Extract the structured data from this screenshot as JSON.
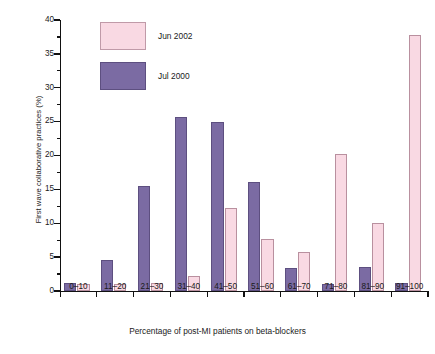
{
  "chart_data": {
    "type": "bar",
    "title": "",
    "xlabel": "Percentage of post-MI patients on beta-blockers",
    "ylabel": "First wave collaborative practices (%)",
    "categories": [
      "0–10",
      "11–20",
      "21–30",
      "31–40",
      "41–50",
      "51–60",
      "61–70",
      "71–80",
      "81–90",
      "91–100"
    ],
    "series": [
      {
        "name": "Jun 2002",
        "color": "#f9d9e3",
        "values": [
          1.1,
          1.1,
          1.2,
          2.2,
          12.2,
          7.7,
          5.8,
          20.2,
          10.0,
          37.8
        ]
      },
      {
        "name": "Jul 2000",
        "color": "#7b6ba3",
        "values": [
          1.2,
          4.6,
          15.5,
          25.7,
          25.0,
          16.1,
          3.4,
          1.1,
          3.5,
          1.2
        ]
      }
    ],
    "ylim": [
      0,
      40
    ],
    "yticks": [
      0,
      5,
      10,
      15,
      20,
      25,
      30,
      35,
      40
    ],
    "yticklabels": [
      "0",
      "5",
      "10",
      "15",
      "20",
      "25",
      "30",
      "35",
      "40"
    ],
    "yminorticks": [
      2.5,
      7.5,
      12.5,
      17.5,
      22.5,
      27.5,
      32.5,
      37.5
    ],
    "grid": false,
    "legend_position": "upper-left-inside"
  },
  "legend": {
    "entries": [
      {
        "label": "Jun 2002",
        "color": "#f9d9e3"
      },
      {
        "label": "Jul 2000",
        "color": "#7b6ba3"
      }
    ]
  },
  "axes": {
    "x_title": "Percentage of post-MI patients on beta-blockers",
    "y_title": "First wave collaborative practices (%)"
  },
  "colors": {
    "jun_2002": "#f9d9e3",
    "jul_2000": "#7b6ba3",
    "axis": "#111111",
    "background": "#ffffff"
  }
}
